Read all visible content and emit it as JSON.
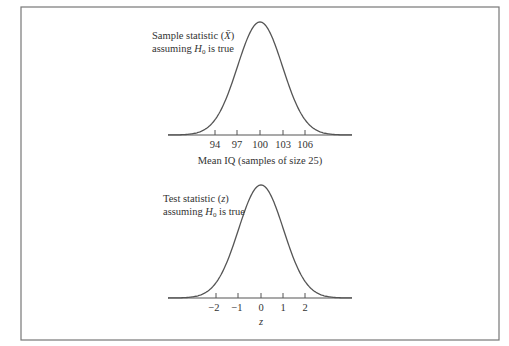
{
  "figure": {
    "top_panel": {
      "annotation_line1_prefix": "Sample statistic (",
      "annotation_symbol": "X̄",
      "annotation_line1_suffix": ")",
      "annotation_line2_prefix": "assuming ",
      "annotation_h": "H",
      "annotation_sub": "0",
      "annotation_line2_suffix": " is true",
      "ticks": [
        "94",
        "97",
        "100",
        "103",
        "106"
      ],
      "axis_label": "Mean IQ (samples of size 25)"
    },
    "bottom_panel": {
      "annotation_line1_prefix": "Test statistic (",
      "annotation_symbol": "z",
      "annotation_line1_suffix": ")",
      "annotation_line2_prefix": "assuming ",
      "annotation_h": "H",
      "annotation_sub": "0",
      "annotation_line2_suffix": " is true",
      "ticks": [
        "−2",
        "−1",
        "0",
        "1",
        "2"
      ],
      "axis_label": "z"
    }
  }
}
